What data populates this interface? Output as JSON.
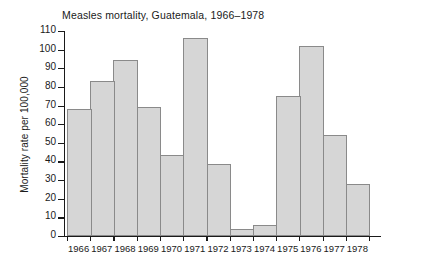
{
  "chart_data": {
    "type": "bar",
    "title": "Measles mortality, Guatemala, 1966–1978",
    "xlabel": "",
    "ylabel": "Mortality rate per 100,000",
    "categories": [
      "1966",
      "1967",
      "1968",
      "1969",
      "1970",
      "1971",
      "1972",
      "1973",
      "1974",
      "1975",
      "1976",
      "1977",
      "1978"
    ],
    "values": [
      68,
      83,
      94.5,
      69,
      43.5,
      106,
      38.5,
      4,
      6,
      75,
      102,
      54,
      28
    ],
    "ylim": [
      0,
      110
    ],
    "ytick_values": [
      0,
      10,
      20,
      30,
      40,
      50,
      60,
      70,
      80,
      90,
      100,
      110
    ],
    "ytick_labels": [
      "0",
      "10",
      "20",
      "30",
      "40",
      "50",
      "60",
      "70",
      "80",
      "90",
      "100",
      "110"
    ],
    "grid": false,
    "legend": null,
    "bar_fill_color": "#d6d6d6",
    "bar_edge_color": "#8a8a8a",
    "axis_color": "#1a1a1a",
    "background_color": "#ffffff"
  }
}
